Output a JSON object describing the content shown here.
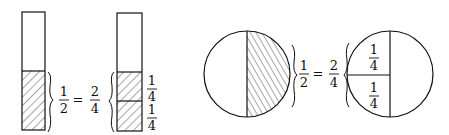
{
  "colors": {
    "stroke": "#111111",
    "background": "#ffffff"
  },
  "bars": {
    "left": {
      "label_num": "1",
      "label_den": "2",
      "shaded_fraction": "1/2"
    },
    "equals": "=",
    "right_eq": {
      "label_num": "2",
      "label_den": "4"
    },
    "right": {
      "parts": [
        {
          "num": "1",
          "den": "4"
        },
        {
          "num": "1",
          "den": "4"
        }
      ]
    }
  },
  "circles": {
    "left": {
      "label_num": "1",
      "label_den": "2",
      "shaded_fraction": "1/2"
    },
    "equals": "=",
    "right_eq": {
      "label_num": "2",
      "label_den": "4"
    },
    "right": {
      "parts": [
        {
          "num": "1",
          "den": "4"
        },
        {
          "num": "1",
          "den": "4"
        }
      ]
    }
  }
}
